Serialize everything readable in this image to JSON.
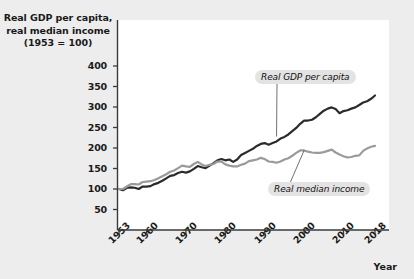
{
  "figure": {
    "background_color": "#ededed",
    "panel_color": "#ffffff"
  },
  "axis": {
    "y_title_line1": "Real GDP per capita,",
    "y_title_line2": "real median income",
    "y_title_line3": "(1953 = 100)",
    "x_title": "Year"
  },
  "chart_data": {
    "type": "line",
    "title": "Real GDP per capita, real median income (1953 = 100)",
    "xlabel": "Year",
    "ylabel": "Real GDP per capita, real median income (1953 = 100)",
    "xlim": [
      1953,
      2018
    ],
    "ylim": [
      0,
      430
    ],
    "grid": false,
    "legend_position": "inline-annotations",
    "ytick_labels": [
      "400",
      "350",
      "300",
      "250",
      "200",
      "150",
      "100",
      "50"
    ],
    "yticks": [
      400,
      350,
      300,
      250,
      200,
      150,
      100,
      50
    ],
    "xtick_labels": [
      "1953",
      "1960",
      "1970",
      "1980",
      "1990",
      "2000",
      "2010",
      "2018"
    ],
    "xticks": [
      1953,
      1960,
      1970,
      1980,
      1990,
      2000,
      2010,
      2018
    ],
    "series": [
      {
        "name": "Real GDP per capita",
        "color": "#2b2b2b",
        "label_x": 2000,
        "label_y": 372,
        "x": [
          1953,
          1954,
          1955,
          1956,
          1957,
          1958,
          1959,
          1960,
          1961,
          1962,
          1963,
          1964,
          1965,
          1966,
          1967,
          1968,
          1969,
          1970,
          1971,
          1972,
          1973,
          1974,
          1975,
          1976,
          1977,
          1978,
          1979,
          1980,
          1981,
          1982,
          1983,
          1984,
          1985,
          1986,
          1987,
          1988,
          1989,
          1990,
          1991,
          1992,
          1993,
          1994,
          1995,
          1996,
          1997,
          1998,
          1999,
          2000,
          2001,
          2002,
          2003,
          2004,
          2005,
          2006,
          2007,
          2008,
          2009,
          2010,
          2011,
          2012,
          2013,
          2014,
          2015,
          2016,
          2017,
          2018
        ],
        "values": [
          100,
          97,
          103,
          104,
          103,
          100,
          106,
          106,
          107,
          112,
          115,
          120,
          126,
          132,
          134,
          139,
          142,
          140,
          143,
          149,
          156,
          153,
          151,
          157,
          163,
          170,
          173,
          170,
          172,
          166,
          172,
          183,
          188,
          193,
          198,
          205,
          210,
          212,
          208,
          212,
          216,
          223,
          227,
          233,
          241,
          249,
          259,
          267,
          267,
          269,
          275,
          283,
          291,
          296,
          299,
          295,
          285,
          290,
          292,
          296,
          299,
          305,
          311,
          314,
          320,
          328
        ]
      },
      {
        "name": "Real median income",
        "color": "#9a9a9a",
        "label_x": 1997,
        "label_y": 118,
        "x": [
          1953,
          1954,
          1955,
          1956,
          1957,
          1958,
          1959,
          1960,
          1961,
          1962,
          1963,
          1964,
          1965,
          1966,
          1967,
          1968,
          1969,
          1970,
          1971,
          1972,
          1973,
          1974,
          1975,
          1976,
          1977,
          1978,
          1979,
          1980,
          1981,
          1982,
          1983,
          1984,
          1985,
          1986,
          1987,
          1988,
          1989,
          1990,
          1991,
          1992,
          1993,
          1994,
          1995,
          1996,
          1997,
          1998,
          1999,
          2000,
          2001,
          2002,
          2003,
          2004,
          2005,
          2006,
          2007,
          2008,
          2009,
          2010,
          2011,
          2012,
          2013,
          2014,
          2015,
          2016,
          2017,
          2018
        ],
        "values": [
          100,
          100,
          106,
          112,
          112,
          111,
          117,
          118,
          119,
          122,
          126,
          131,
          136,
          142,
          145,
          151,
          157,
          155,
          154,
          161,
          166,
          160,
          156,
          159,
          161,
          167,
          167,
          160,
          157,
          155,
          155,
          159,
          162,
          168,
          170,
          172,
          176,
          173,
          167,
          166,
          164,
          167,
          172,
          175,
          181,
          188,
          194,
          194,
          191,
          189,
          188,
          188,
          190,
          193,
          196,
          189,
          184,
          180,
          177,
          178,
          181,
          182,
          193,
          199,
          203,
          205
        ]
      }
    ]
  }
}
